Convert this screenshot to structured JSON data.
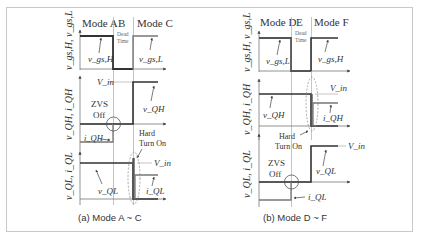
{
  "figure": {
    "panels": [
      {
        "id": "a",
        "caption": "(a) Mode A ~ C",
        "modes": [
          "Mode A",
          "B",
          "Mode C"
        ],
        "dead_time_label": [
          "Dead",
          "Time"
        ],
        "axis_labels": {
          "gate": "v_gs,H, v_gs,L",
          "high_side": "v_QH, i_QH",
          "low_side": "v_QL, i_QL"
        },
        "gate_labels": {
          "first": "v_gs,H",
          "second": "v_gs,L"
        },
        "vin_label": "V_in",
        "high_side_labels": {
          "voltage": "v_QH",
          "current": "i_QH"
        },
        "low_side_labels": {
          "voltage": "v_QL",
          "current": "i_QL",
          "vin": "V_in"
        },
        "annotations": {
          "zvs": [
            "ZVS",
            "Off"
          ],
          "hard": [
            "Hard",
            "Turn On"
          ]
        }
      },
      {
        "id": "b",
        "caption": "(b) Mode D ~ F",
        "modes": [
          "Mode D",
          "E",
          "Mode F"
        ],
        "dead_time_label": [
          "Dead",
          "Time"
        ],
        "axis_labels": {
          "gate": "v_gs,H, v_gs,L",
          "high_side": "v_QH, i_QH",
          "low_side": "v_QL, i_QL"
        },
        "gate_labels": {
          "first": "v_gs,L",
          "second": "v_gs,H"
        },
        "vin_label": "V_in",
        "high_side_labels": {
          "voltage": "v_QH",
          "current": "i_QH"
        },
        "low_side_labels": {
          "voltage": "v_QL",
          "current": "i_QL",
          "vin": "V_in"
        },
        "annotations": {
          "zvs": [
            "ZVS",
            "Off"
          ],
          "hard": [
            "Hard",
            "Turn On"
          ]
        }
      }
    ],
    "colors": {
      "waveform": "#333333",
      "waveform_thick": "#555555",
      "gray": "#8c8c8c",
      "light": "#b5b5b5",
      "border": "#c9c9c9"
    }
  }
}
